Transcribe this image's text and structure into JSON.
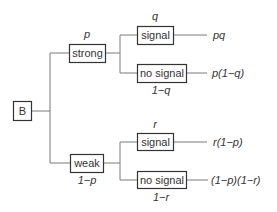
{
  "diagram": {
    "type": "probability-tree",
    "root": {
      "label": "B"
    },
    "branches": [
      {
        "label": "strong",
        "prob_above": "p",
        "children": [
          {
            "label": "signal",
            "prob_above": "q",
            "outcome": "pq"
          },
          {
            "label": "no signal",
            "prob_below": "1−q",
            "outcome": "p(1−q)"
          }
        ]
      },
      {
        "label": "weak",
        "prob_below": "1−p",
        "children": [
          {
            "label": "signal",
            "prob_above": "r",
            "outcome": "r(1−p)"
          },
          {
            "label": "no signal",
            "prob_below": "1−r",
            "outcome": "(1−p)(1−r)"
          }
        ]
      }
    ],
    "colors": {
      "line": "#7a7a7a",
      "box_border": "#333333",
      "text": "#333333"
    }
  }
}
